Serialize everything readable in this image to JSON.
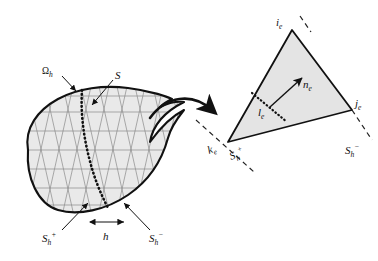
{
  "figure": {
    "colors": {
      "outline": "#111111",
      "mesh_line": "#808080",
      "domain_fill": "#e9e9e9",
      "triangle_fill": "#e4e4e4",
      "dotted_curve": "#111111",
      "dashed_line": "#222222",
      "background": "#ffffff",
      "label_text": "#111111"
    },
    "labels": {
      "domain": {
        "base": "Ω",
        "sub": "h",
        "text": "Ωh"
      },
      "surface": {
        "base": "S",
        "sub": "",
        "text": "S"
      },
      "surface_plus_left": {
        "base": "S",
        "sub": "h",
        "sup": "+",
        "text": "Sh+"
      },
      "surface_minus_left": {
        "base": "S",
        "sub": "h",
        "sup": "−",
        "text": "Sh−"
      },
      "mesh_size": {
        "base": "h",
        "text": "h"
      },
      "vertex_i": {
        "base": "i",
        "sub": "e",
        "text": "ie"
      },
      "vertex_j": {
        "base": "j",
        "sub": "e",
        "text": "je"
      },
      "vertex_k": {
        "base": "k",
        "sub": "e",
        "text": "ke"
      },
      "normal": {
        "base": "n",
        "sub": "e",
        "text": "ne"
      },
      "segment_l": {
        "base": "l",
        "sub": "e",
        "text": "le"
      },
      "surface_plus_right": {
        "base": "S",
        "sub": "h",
        "sup": "+",
        "text": "Sh+"
      },
      "surface_minus_right": {
        "base": "S",
        "sub": "h",
        "sup": "−",
        "text": "Sh−"
      }
    },
    "elements": {
      "domain_region_name": "meshed-domain-blob",
      "interface_curve_name": "interface-curve-S",
      "zoom_connector_name": "zoom-callout-arrow",
      "reference_element_name": "reference-triangle-element",
      "normal_vector_name": "normal-vector-arrow",
      "mesh_size_indicator_name": "mesh-size-double-arrow"
    }
  }
}
